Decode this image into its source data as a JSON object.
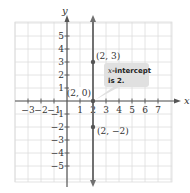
{
  "chart_data": {
    "type": "line",
    "title": "",
    "xlabel": "x",
    "ylabel": "y",
    "xlim": [
      -4,
      8
    ],
    "ylim": [
      -6,
      6
    ],
    "grid": true,
    "x_ticks": [
      -3,
      -2,
      -1,
      1,
      2,
      3,
      4,
      5,
      6,
      7
    ],
    "y_ticks": [
      -5,
      -4,
      -3,
      -2,
      -1,
      1,
      2,
      3,
      4,
      5
    ],
    "series": [
      {
        "name": "x = 2",
        "kind": "vertical-line",
        "x": 2,
        "color": "#666666"
      }
    ],
    "points": [
      {
        "x": 2,
        "y": 3,
        "label": "(2, 3)"
      },
      {
        "x": 2,
        "y": 0,
        "label": "(2, 0)"
      },
      {
        "x": 2,
        "y": -2,
        "label": "(2, −2)"
      }
    ],
    "annotations": [
      {
        "text_line1": "x-intercept",
        "text_line2": "is 2.",
        "points_to": [
          2,
          0
        ]
      }
    ]
  },
  "labels": {
    "x_axis": "x",
    "y_axis": "y",
    "callout_line1_italic": "x",
    "callout_line1_rest": "-intercept",
    "callout_line2": "is 2."
  },
  "colors": {
    "grid": "#dddddd",
    "axis": "#555555",
    "line": "#707070",
    "callout_bg": "#e0e0e0"
  }
}
